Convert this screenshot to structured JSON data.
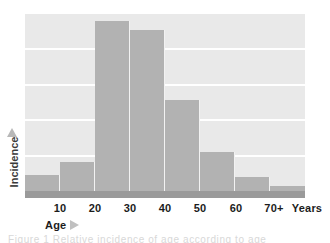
{
  "figure": {
    "caption": "Figure 1  Relative incidence of age according to age",
    "background_color": "#ffffff",
    "plot_background_color": "#e9e9e9",
    "bar_color": "#b2b2b2",
    "gridline_color": "#ffffff",
    "baseline_color": "#9a9a9a"
  },
  "axes": {
    "y_label": "Incidence",
    "y_arrow_icon": "up-triangle-icon",
    "x_label": "Age",
    "x_arrow_icon": "right-triangle-icon",
    "x_unit_label": "Years"
  },
  "chart_data": {
    "type": "bar",
    "title": "",
    "xlabel": "Age",
    "ylabel": "Incidence",
    "grid": true,
    "legend": "none",
    "xlim": [
      0,
      80
    ],
    "ylim": [
      0,
      100
    ],
    "gridline_values": [
      20,
      40,
      60,
      80,
      100
    ],
    "bin_edges": [
      0,
      10,
      20,
      30,
      40,
      50,
      60,
      70,
      80
    ],
    "categories": [
      "0-10",
      "10-20",
      "20-30",
      "30-40",
      "40-50",
      "50-60",
      "60-70",
      "70+"
    ],
    "tick_labels": [
      "10",
      "20",
      "30",
      "40",
      "50",
      "60",
      "70+",
      "Years"
    ],
    "values": [
      9,
      16,
      95,
      90,
      51,
      22,
      8,
      3
    ],
    "series": [
      {
        "name": "Incidence",
        "values": [
          9,
          16,
          95,
          90,
          51,
          22,
          8,
          3
        ]
      }
    ]
  },
  "x_ticks": [
    {
      "label": "10",
      "x": 60
    },
    {
      "label": "20",
      "x": 95
    },
    {
      "label": "30",
      "x": 130
    },
    {
      "label": "40",
      "x": 165
    },
    {
      "label": "50",
      "x": 200
    },
    {
      "label": "60",
      "x": 236
    },
    {
      "label": "70+",
      "x": 274
    },
    {
      "label": "Years",
      "x": 307
    }
  ]
}
